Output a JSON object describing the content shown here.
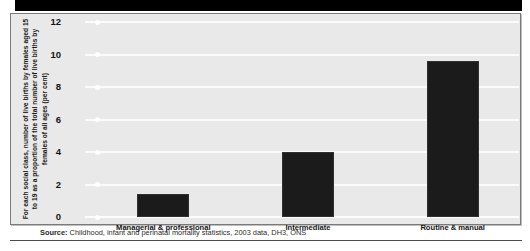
{
  "figure": {
    "banner_color": "#000000",
    "plot_background": "#e9e9e9",
    "bar_color": "#1b1b1b",
    "gridline_color": "#fbfbfb"
  },
  "source": {
    "prefix": "Source:",
    "text": " Childhood, infant and perinatal mortality statistics, 2003 data, DH3, ONS"
  },
  "chart_data": {
    "type": "bar",
    "title": "",
    "subtitle": "",
    "xlabel": "",
    "ylabel": "For each social class, number of live births by females aged 15 to 19 as a proportion of the total number of live births by females of all ages (per cent)",
    "categories": [
      "Managerial & professional",
      "Intermediate",
      "Routine & manual"
    ],
    "values": [
      1.4,
      4.0,
      9.6
    ],
    "ylim": [
      0,
      12
    ],
    "yticks": [
      0,
      2,
      4,
      6,
      8,
      10,
      12
    ],
    "ytick_labels": [
      "0",
      "2",
      "4",
      "6",
      "8",
      "10",
      "12"
    ],
    "grid": true,
    "legend": "none",
    "series": [
      {
        "name": "Teenage births share",
        "values": [
          1.4,
          4.0,
          9.6
        ]
      }
    ]
  }
}
